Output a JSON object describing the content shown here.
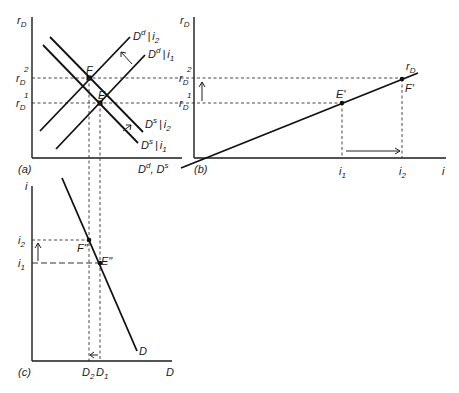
{
  "panels": {
    "a": {
      "tag": "(a)",
      "y_axis": "r",
      "y_axis_sub": "D",
      "x_axis_main": "D",
      "x_axis_sup1": "d",
      "x_axis_sep": ", D",
      "x_axis_sup2": "s",
      "r2_base": "r",
      "r2_sub": "D",
      "r2_sup": "2",
      "r1_base": "r",
      "r1_sub": "D",
      "r1_sup": "1",
      "point_F": "F",
      "point_E": "E",
      "curves": {
        "dd_i2": {
          "base": "D",
          "sup": "d",
          "bar": "|",
          "i": "i",
          "sub": "2"
        },
        "dd_i1": {
          "base": "D",
          "sup": "d",
          "bar": "|",
          "i": "i",
          "sub": "1"
        },
        "ds_i2": {
          "base": "D",
          "sup": "s",
          "bar": "|",
          "i": "i",
          "sub": "2"
        },
        "ds_i1": {
          "base": "D",
          "sup": "s",
          "bar": "|",
          "i": "i",
          "sub": "1"
        }
      }
    },
    "b": {
      "tag": "(b)",
      "y_axis": "r",
      "y_axis_sub": "D",
      "x_axis": "i",
      "r2_base": "r",
      "r2_sub": "D",
      "r2_sup": "2",
      "r1_base": "r",
      "r1_sub": "D",
      "r1_sup": "1",
      "line_label": "r",
      "line_label_sub": "D",
      "point_E": "E'",
      "point_F": "F'",
      "i1": "i",
      "i1_sub": "1",
      "i2": "i",
      "i2_sub": "2"
    },
    "c": {
      "tag": "(c)",
      "y_axis": "i",
      "x_axis": "D",
      "i2": "i",
      "i2_sub": "2",
      "i1": "i",
      "i1_sub": "1",
      "point_F": "F\"",
      "point_E": "E\"",
      "line_label": "D",
      "d2": "D",
      "d2_sub": "2",
      "d1": "D",
      "d1_sub": "1"
    }
  }
}
